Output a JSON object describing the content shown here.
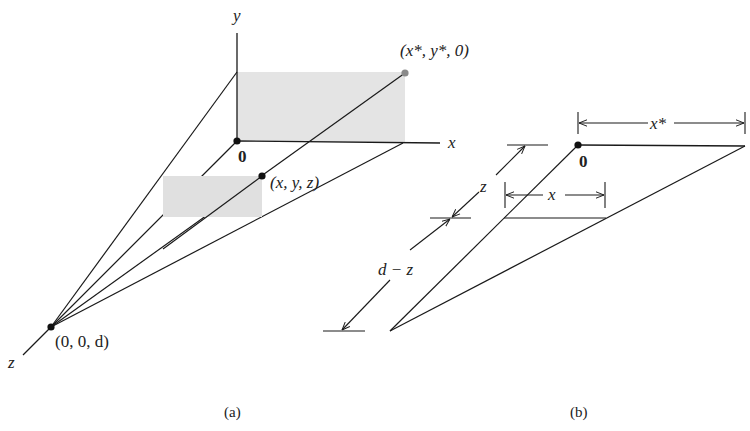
{
  "figure_a": {
    "caption": "(a)",
    "axis_labels": {
      "x": "x",
      "y": "y",
      "z": "z"
    },
    "origin_label": "0",
    "points": {
      "projected": "(x*, y*, 0)",
      "object": "(x, y, z)",
      "eye": "(0, 0, d)"
    },
    "colors": {
      "plane_fill": "#e4e4e4",
      "line": "#1a1a1a",
      "projected_point": "#8a8a8a"
    }
  },
  "figure_b": {
    "caption": "(b)",
    "origin_label": "0",
    "dimensions": {
      "x_star": "x*",
      "x": "x",
      "z": "z",
      "d_minus_z": "d − z"
    }
  }
}
